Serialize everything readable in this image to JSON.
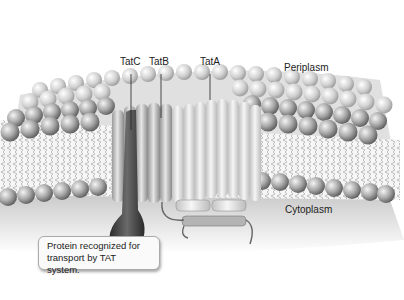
{
  "diagram": {
    "labels": {
      "tatc": "TatC",
      "tatb": "TatB",
      "tata": "TatA",
      "periplasm": "Periplasm",
      "cytoplasm": "Cytoplasm"
    },
    "callout": {
      "line1": "Protein recognized for",
      "line2": "transport by TAT system."
    },
    "colors": {
      "background": "#ffffff",
      "lipid_head": "#8a8a8a",
      "lipid_tail": "#cfcfcf",
      "cytoplasm": "#d6d6d6",
      "protein_dark": "#4a4a4a",
      "helix_light": "#e4e4e4",
      "helix_mid": "#b8b8b8"
    }
  }
}
